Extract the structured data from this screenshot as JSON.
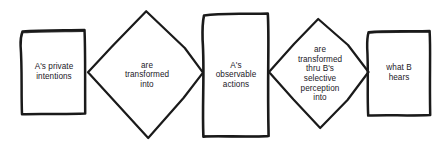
{
  "diagram": {
    "style": {
      "background": "#ffffff",
      "ink": "#1a1a1a",
      "text_color": "#23201f"
    },
    "nodes": [
      {
        "id": "node-1",
        "name": "a-private-intentions",
        "shape": "rectangle",
        "label": "A's private\nintentions",
        "order": 1
      },
      {
        "id": "node-2",
        "name": "are-transformed-into",
        "shape": "diamond",
        "label": "are\ntransformed\ninto",
        "order": 2
      },
      {
        "id": "node-3",
        "name": "a-observable-actions",
        "shape": "rectangle",
        "label": "A's\nobservable\nactions",
        "order": 3
      },
      {
        "id": "node-4",
        "name": "are-transformed-thru-b-selective-perception-into",
        "shape": "diamond",
        "label": "are\ntransformed\nthru B's\nselective\nperception\ninto",
        "order": 4
      },
      {
        "id": "node-5",
        "name": "what-b-hears",
        "shape": "rectangle",
        "label": "what B\nhears",
        "order": 5
      }
    ]
  }
}
